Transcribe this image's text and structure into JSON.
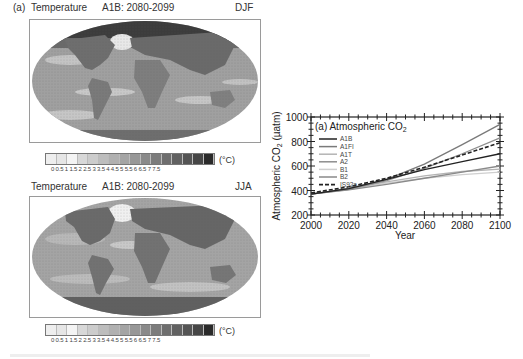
{
  "panels": {
    "djf": {
      "label": "(a)",
      "variable": "Temperature",
      "scenario": "A1B: 2080-2099",
      "season": "DJF"
    },
    "jja": {
      "variable": "Temperature",
      "scenario": "A1B: 2080-2099",
      "season": "JJA"
    }
  },
  "colorbar": {
    "ticks": [
      "0",
      "0.5",
      "1",
      "1.5",
      "2",
      "2.5",
      "3",
      "3.5",
      "4",
      "4.5",
      "5",
      "5.5",
      "6",
      "6.5",
      "7",
      "7.5"
    ],
    "tick_string": "0 0.5 1 1.5 2 2.5 3 3.5 4 4.5 5 5.5 6 6.5 7 7.5",
    "unit": "(°C)",
    "colors": [
      "#eeeeee",
      "#e6e6e6",
      "#f4f4f4",
      "#d8d8d8",
      "#cccccc",
      "#bdbdbd",
      "#b0b0b0",
      "#a4a4a4",
      "#979797",
      "#8a8a8a",
      "#7c7c7c",
      "#6e6e6e",
      "#616161",
      "#545454",
      "#464646",
      "#2a2a2a"
    ]
  },
  "chart_data": {
    "type": "line",
    "title": "(a) Atmospheric CO2",
    "title_main": "(a) Atmospheric CO",
    "title_sub": "2",
    "xlabel": "Year",
    "ylabel": "Atmospheric CO2 (µatm)",
    "ylabel_main": "Atmospheric CO",
    "ylabel_sub": "2",
    "ylabel_unit": " (µatm)",
    "xlim": [
      2000,
      2100
    ],
    "ylim": [
      200,
      1000
    ],
    "xticks": [
      "2000",
      "2020",
      "2040",
      "2060",
      "2080",
      "2100"
    ],
    "yticks": [
      "200",
      "400",
      "600",
      "800",
      "1000"
    ],
    "grid": false,
    "legend_position": "upper left",
    "x": [
      2000,
      2020,
      2040,
      2060,
      2080,
      2100
    ],
    "series": [
      {
        "name": "A1B",
        "color": "#222222",
        "dash": false,
        "values": [
          370,
          415,
          490,
          570,
          635,
          700
        ]
      },
      {
        "name": "A1FI",
        "color": "#7a7a7a",
        "dash": false,
        "values": [
          370,
          415,
          490,
          615,
          775,
          940
        ]
      },
      {
        "name": "A1T",
        "color": "#b4b4b4",
        "dash": false,
        "values": [
          370,
          415,
          470,
          520,
          555,
          575
        ]
      },
      {
        "name": "A2",
        "color": "#8e8e8e",
        "dash": false,
        "values": [
          370,
          410,
          480,
          580,
          700,
          830
        ]
      },
      {
        "name": "B1",
        "color": "#cfcfcf",
        "dash": false,
        "values": [
          370,
          410,
          460,
          500,
          530,
          550
        ]
      },
      {
        "name": "B2",
        "color": "#8a8a8a",
        "dash": false,
        "values": [
          370,
          405,
          450,
          500,
          550,
          600
        ]
      },
      {
        "name": "IS92a",
        "color": "#222222",
        "dash": true,
        "values": [
          380,
          430,
          500,
          590,
          690,
          790
        ]
      }
    ]
  }
}
